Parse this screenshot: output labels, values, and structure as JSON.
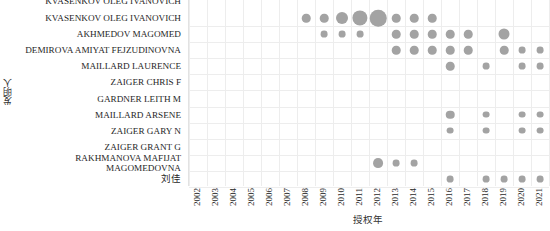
{
  "chart_data": {
    "type": "scatter",
    "title": "",
    "xlabel": "授权年",
    "ylabel": "发明人",
    "x_categories": [
      "2002",
      "2003",
      "2004",
      "2005",
      "2006",
      "2007",
      "2008",
      "2009",
      "2010",
      "2011",
      "2012",
      "2013",
      "2014",
      "2015",
      "2016",
      "2017",
      "2018",
      "2019",
      "2020",
      "2021"
    ],
    "y_categories": [
      "KVASENKOV OLEG IVANOVICH",
      "AKHMEDOV MAGOMED",
      "DEMIROVA AMIYAT FEJZUDINOVNA",
      "MAILLARD LAURENCE",
      "ZAIGER CHRIS F",
      "GARDNER LEITH M",
      "MAILLARD ARSENE",
      "ZAIGER GARY N",
      "ZAIGER GRANT G",
      "RAKHMANOVA MAFIJAT MAGOMEDOVNA",
      "刘佳"
    ],
    "clipped_top_label": "KVASENKOV OLEG IVANOVICH",
    "bubble_color": "#a3a3a3",
    "grid": true,
    "legend": "none",
    "size_encodes": "count",
    "points": [
      {
        "x": "2008",
        "y": "KVASENKOV OLEG IVANOVICH",
        "size": 2
      },
      {
        "x": "2009",
        "y": "KVASENKOV OLEG IVANOVICH",
        "size": 2
      },
      {
        "x": "2010",
        "y": "KVASENKOV OLEG IVANOVICH",
        "size": 5
      },
      {
        "x": "2011",
        "y": "KVASENKOV OLEG IVANOVICH",
        "size": 9
      },
      {
        "x": "2012",
        "y": "KVASENKOV OLEG IVANOVICH",
        "size": 11
      },
      {
        "x": "2013",
        "y": "KVASENKOV OLEG IVANOVICH",
        "size": 2
      },
      {
        "x": "2014",
        "y": "KVASENKOV OLEG IVANOVICH",
        "size": 2
      },
      {
        "x": "2015",
        "y": "KVASENKOV OLEG IVANOVICH",
        "size": 2
      },
      {
        "x": "2009",
        "y": "AKHMEDOV MAGOMED",
        "size": 1
      },
      {
        "x": "2010",
        "y": "AKHMEDOV MAGOMED",
        "size": 1
      },
      {
        "x": "2011",
        "y": "AKHMEDOV MAGOMED",
        "size": 1
      },
      {
        "x": "2013",
        "y": "AKHMEDOV MAGOMED",
        "size": 2
      },
      {
        "x": "2014",
        "y": "AKHMEDOV MAGOMED",
        "size": 2
      },
      {
        "x": "2015",
        "y": "AKHMEDOV MAGOMED",
        "size": 2
      },
      {
        "x": "2016",
        "y": "AKHMEDOV MAGOMED",
        "size": 2
      },
      {
        "x": "2017",
        "y": "AKHMEDOV MAGOMED",
        "size": 2
      },
      {
        "x": "2019",
        "y": "AKHMEDOV MAGOMED",
        "size": 4
      },
      {
        "x": "2013",
        "y": "DEMIROVA AMIYAT FEJZUDINOVNA",
        "size": 2
      },
      {
        "x": "2014",
        "y": "DEMIROVA AMIYAT FEJZUDINOVNA",
        "size": 2
      },
      {
        "x": "2015",
        "y": "DEMIROVA AMIYAT FEJZUDINOVNA",
        "size": 2
      },
      {
        "x": "2016",
        "y": "DEMIROVA AMIYAT FEJZUDINOVNA",
        "size": 2
      },
      {
        "x": "2017",
        "y": "DEMIROVA AMIYAT FEJZUDINOVNA",
        "size": 2
      },
      {
        "x": "2019",
        "y": "DEMIROVA AMIYAT FEJZUDINOVNA",
        "size": 2
      },
      {
        "x": "2020",
        "y": "DEMIROVA AMIYAT FEJZUDINOVNA",
        "size": 1
      },
      {
        "x": "2021",
        "y": "DEMIROVA AMIYAT FEJZUDINOVNA",
        "size": 1
      },
      {
        "x": "2016",
        "y": "MAILLARD LAURENCE",
        "size": 2
      },
      {
        "x": "2018",
        "y": "MAILLARD LAURENCE",
        "size": 1
      },
      {
        "x": "2020",
        "y": "MAILLARD LAURENCE",
        "size": 1
      },
      {
        "x": "2021",
        "y": "MAILLARD LAURENCE",
        "size": 1
      },
      {
        "x": "2016",
        "y": "MAILLARD ARSENE",
        "size": 2
      },
      {
        "x": "2018",
        "y": "MAILLARD ARSENE",
        "size": 1
      },
      {
        "x": "2020",
        "y": "MAILLARD ARSENE",
        "size": 1
      },
      {
        "x": "2021",
        "y": "MAILLARD ARSENE",
        "size": 1
      },
      {
        "x": "2016",
        "y": "ZAIGER GARY N",
        "size": 1
      },
      {
        "x": "2018",
        "y": "ZAIGER GARY N",
        "size": 1
      },
      {
        "x": "2020",
        "y": "ZAIGER GARY N",
        "size": 1
      },
      {
        "x": "2021",
        "y": "ZAIGER GARY N",
        "size": 1
      },
      {
        "x": "2012",
        "y": "RAKHMANOVA MAFIJAT MAGOMEDOVNA",
        "size": 3
      },
      {
        "x": "2013",
        "y": "RAKHMANOVA MAFIJAT MAGOMEDOVNA",
        "size": 1
      },
      {
        "x": "2014",
        "y": "RAKHMANOVA MAFIJAT MAGOMEDOVNA",
        "size": 1
      },
      {
        "x": "2016",
        "y": "刘佳",
        "size": 1
      },
      {
        "x": "2018",
        "y": "刘佳",
        "size": 1
      },
      {
        "x": "2019",
        "y": "刘佳",
        "size": 1
      },
      {
        "x": "2020",
        "y": "刘佳",
        "size": 1
      },
      {
        "x": "2021",
        "y": "刘佳",
        "size": 1
      }
    ]
  }
}
